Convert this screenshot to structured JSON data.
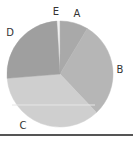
{
  "chart_data": {
    "type": "pie",
    "title": "",
    "start_angle_deg": -3.5,
    "direction": "clockwise",
    "center": [
      60,
      74
    ],
    "radius": 53,
    "legend": "none",
    "labels_on_chart": true,
    "slices": [
      {
        "label": "E",
        "value": 1,
        "color": "#f0f0f0",
        "label_pos": [
          56,
          12
        ]
      },
      {
        "label": "A",
        "value": 8.6,
        "color": "#a9a9a9",
        "label_pos": [
          77,
          14
        ]
      },
      {
        "label": "B",
        "value": 29.3,
        "color": "#b6b6b6",
        "label_pos": [
          120,
          70
        ]
      },
      {
        "label": "C",
        "value": 35.8,
        "color": "#cfcfcf",
        "label_pos": [
          23,
          126
        ]
      },
      {
        "label": "D",
        "value": 25.3,
        "color": "#9f9f9f",
        "label_pos": [
          10,
          33
        ]
      }
    ]
  }
}
